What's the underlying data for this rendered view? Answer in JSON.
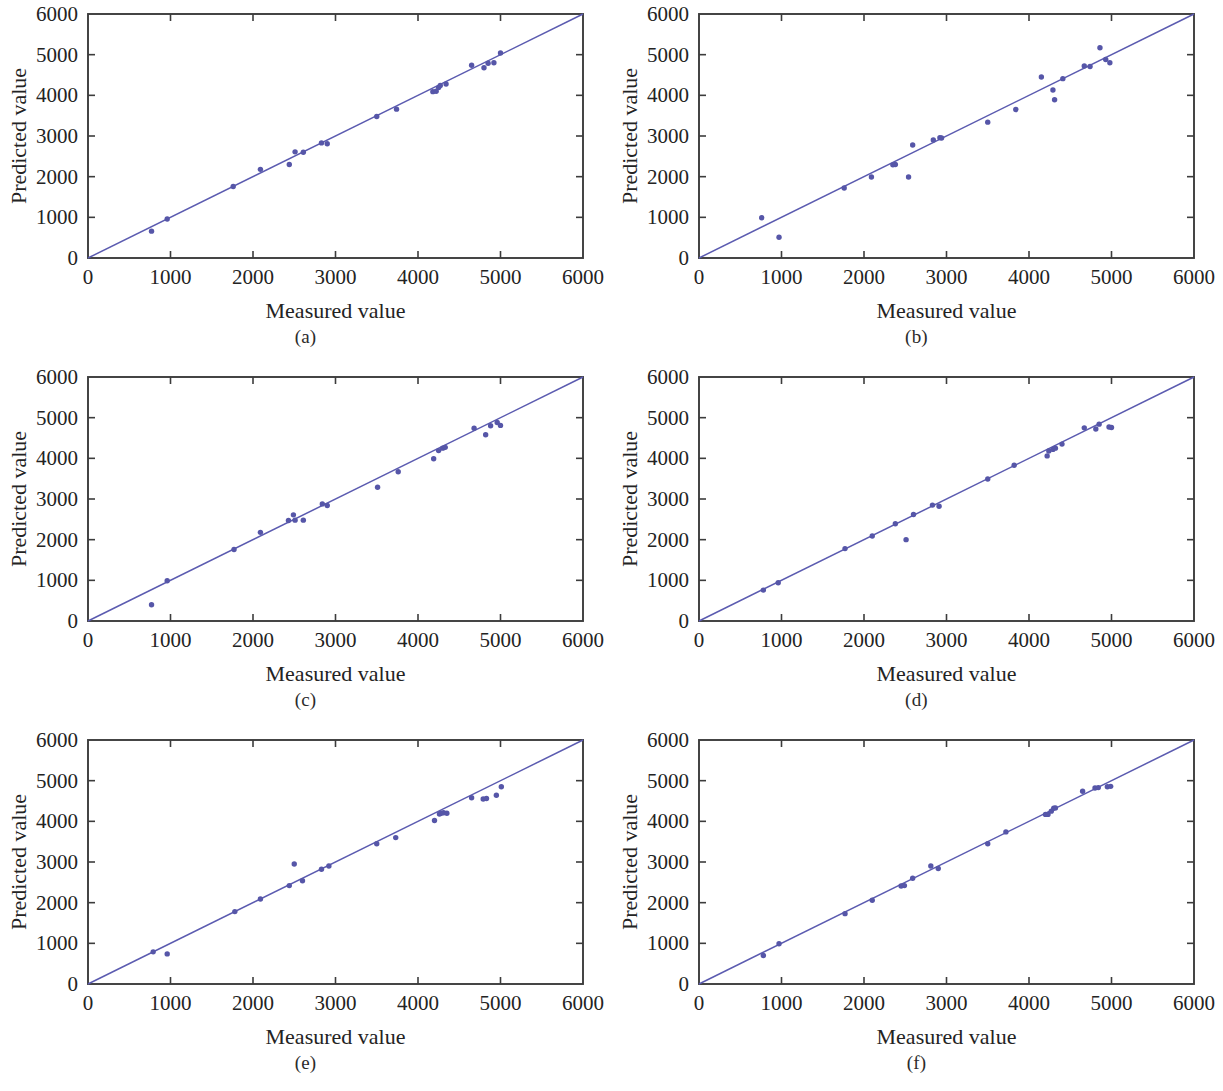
{
  "figure": {
    "panel_count": 6,
    "background": "#ffffff",
    "marker_color": "#5656a8",
    "line_color": "#5b5bb0",
    "axis_color": "#3c3c3c"
  },
  "chart_data": [
    {
      "type": "scatter",
      "panel": "(a)",
      "title": "",
      "xlabel": "Measured value",
      "ylabel": "Predicted value",
      "xlim": [
        0,
        6000
      ],
      "ylim": [
        0,
        6000
      ],
      "xticks": [
        0,
        1000,
        2000,
        3000,
        4000,
        5000,
        6000
      ],
      "yticks": [
        0,
        1000,
        2000,
        3000,
        4000,
        5000,
        6000
      ],
      "xticklabels": [
        "0",
        "1000",
        "2000",
        "3000",
        "4000",
        "5000",
        "6000"
      ],
      "yticklabels": [
        "0",
        "1000",
        "2000",
        "3000",
        "4000",
        "5000",
        "6000"
      ],
      "grid": false,
      "legend": "none",
      "reference_line": {
        "label": "y = x",
        "from": [
          0,
          0
        ],
        "to": [
          6000,
          6000
        ]
      },
      "points": [
        [
          770,
          660
        ],
        [
          960,
          960
        ],
        [
          1760,
          1760
        ],
        [
          2090,
          2180
        ],
        [
          2440,
          2300
        ],
        [
          2510,
          2610
        ],
        [
          2610,
          2600
        ],
        [
          2830,
          2830
        ],
        [
          2900,
          2810
        ],
        [
          3500,
          3480
        ],
        [
          3740,
          3660
        ],
        [
          4180,
          4090
        ],
        [
          4220,
          4100
        ],
        [
          4250,
          4190
        ],
        [
          4270,
          4240
        ],
        [
          4340,
          4280
        ],
        [
          4650,
          4740
        ],
        [
          4800,
          4680
        ],
        [
          4850,
          4790
        ],
        [
          4920,
          4800
        ],
        [
          5000,
          5040
        ]
      ]
    },
    {
      "type": "scatter",
      "panel": "(b)",
      "title": "",
      "xlabel": "Measured value",
      "ylabel": "Predicted value",
      "xlim": [
        0,
        6000
      ],
      "ylim": [
        0,
        6000
      ],
      "xticks": [
        0,
        1000,
        2000,
        3000,
        4000,
        5000,
        6000
      ],
      "yticks": [
        0,
        1000,
        2000,
        3000,
        4000,
        5000,
        6000
      ],
      "xticklabels": [
        "0",
        "1000",
        "2000",
        "3000",
        "4000",
        "5000",
        "6000"
      ],
      "yticklabels": [
        "0",
        "1000",
        "2000",
        "3000",
        "4000",
        "5000",
        "6000"
      ],
      "grid": false,
      "legend": "none",
      "reference_line": {
        "label": "y = x",
        "from": [
          0,
          0
        ],
        "to": [
          6000,
          6000
        ]
      },
      "points": [
        [
          760,
          990
        ],
        [
          970,
          510
        ],
        [
          1760,
          1720
        ],
        [
          2090,
          1990
        ],
        [
          2350,
          2290
        ],
        [
          2380,
          2300
        ],
        [
          2540,
          1990
        ],
        [
          2590,
          2780
        ],
        [
          2840,
          2900
        ],
        [
          2920,
          2960
        ],
        [
          2940,
          2950
        ],
        [
          3500,
          3340
        ],
        [
          3840,
          3650
        ],
        [
          4150,
          4450
        ],
        [
          4290,
          4130
        ],
        [
          4310,
          3890
        ],
        [
          4410,
          4410
        ],
        [
          4670,
          4720
        ],
        [
          4740,
          4710
        ],
        [
          4860,
          5170
        ],
        [
          4930,
          4880
        ],
        [
          4980,
          4800
        ]
      ]
    },
    {
      "type": "scatter",
      "panel": "(c)",
      "title": "",
      "xlabel": "Measured value",
      "ylabel": "Predicted value",
      "xlim": [
        0,
        6000
      ],
      "ylim": [
        0,
        6000
      ],
      "xticks": [
        0,
        1000,
        2000,
        3000,
        4000,
        5000,
        6000
      ],
      "yticks": [
        0,
        1000,
        2000,
        3000,
        4000,
        5000,
        6000
      ],
      "xticklabels": [
        "0",
        "1000",
        "2000",
        "3000",
        "4000",
        "5000",
        "6000"
      ],
      "yticklabels": [
        "0",
        "1000",
        "2000",
        "3000",
        "4000",
        "5000",
        "6000"
      ],
      "grid": false,
      "legend": "none",
      "reference_line": {
        "label": "y = x",
        "from": [
          0,
          0
        ],
        "to": [
          6000,
          6000
        ]
      },
      "points": [
        [
          770,
          400
        ],
        [
          960,
          990
        ],
        [
          1770,
          1760
        ],
        [
          2090,
          2180
        ],
        [
          2430,
          2470
        ],
        [
          2490,
          2610
        ],
        [
          2510,
          2480
        ],
        [
          2610,
          2480
        ],
        [
          2840,
          2880
        ],
        [
          2900,
          2840
        ],
        [
          3510,
          3290
        ],
        [
          3760,
          3670
        ],
        [
          4190,
          3990
        ],
        [
          4250,
          4190
        ],
        [
          4300,
          4250
        ],
        [
          4330,
          4270
        ],
        [
          4680,
          4740
        ],
        [
          4820,
          4580
        ],
        [
          4880,
          4800
        ],
        [
          4960,
          4880
        ],
        [
          5000,
          4810
        ]
      ]
    },
    {
      "type": "scatter",
      "panel": "(d)",
      "title": "",
      "xlabel": "Measured value",
      "ylabel": "Predicted value",
      "xlim": [
        0,
        6000
      ],
      "ylim": [
        0,
        6000
      ],
      "xticks": [
        0,
        1000,
        2000,
        3000,
        4000,
        5000,
        6000
      ],
      "yticks": [
        0,
        1000,
        2000,
        3000,
        4000,
        5000,
        6000
      ],
      "xticklabels": [
        "0",
        "1000",
        "2000",
        "3000",
        "4000",
        "5000",
        "6000"
      ],
      "yticklabels": [
        "0",
        "1000",
        "2000",
        "3000",
        "4000",
        "5000",
        "6000"
      ],
      "grid": false,
      "legend": "none",
      "reference_line": {
        "label": "y = x",
        "from": [
          0,
          0
        ],
        "to": [
          6000,
          6000
        ]
      },
      "points": [
        [
          780,
          760
        ],
        [
          960,
          940
        ],
        [
          1770,
          1780
        ],
        [
          2100,
          2090
        ],
        [
          2380,
          2390
        ],
        [
          2510,
          2000
        ],
        [
          2600,
          2620
        ],
        [
          2830,
          2850
        ],
        [
          2910,
          2820
        ],
        [
          3500,
          3490
        ],
        [
          3820,
          3830
        ],
        [
          4220,
          4060
        ],
        [
          4240,
          4180
        ],
        [
          4290,
          4220
        ],
        [
          4320,
          4250
        ],
        [
          4400,
          4350
        ],
        [
          4670,
          4750
        ],
        [
          4810,
          4720
        ],
        [
          4850,
          4840
        ],
        [
          4970,
          4770
        ],
        [
          5000,
          4760
        ]
      ]
    },
    {
      "type": "scatter",
      "panel": "(e)",
      "title": "",
      "xlabel": "Measured value",
      "ylabel": "Predicted value",
      "xlim": [
        0,
        6000
      ],
      "ylim": [
        0,
        6000
      ],
      "xticks": [
        0,
        1000,
        2000,
        3000,
        4000,
        5000,
        6000
      ],
      "yticks": [
        0,
        1000,
        2000,
        3000,
        4000,
        5000,
        6000
      ],
      "xticklabels": [
        "0",
        "1000",
        "2000",
        "3000",
        "4000",
        "5000",
        "6000"
      ],
      "yticklabels": [
        "0",
        "1000",
        "2000",
        "3000",
        "4000",
        "5000",
        "6000"
      ],
      "grid": false,
      "legend": "none",
      "reference_line": {
        "label": "y = x",
        "from": [
          0,
          0
        ],
        "to": [
          6000,
          6000
        ]
      },
      "points": [
        [
          790,
          790
        ],
        [
          960,
          740
        ],
        [
          1780,
          1780
        ],
        [
          2090,
          2090
        ],
        [
          2440,
          2420
        ],
        [
          2500,
          2950
        ],
        [
          2600,
          2540
        ],
        [
          2830,
          2820
        ],
        [
          2920,
          2900
        ],
        [
          3500,
          3450
        ],
        [
          3730,
          3600
        ],
        [
          4200,
          4020
        ],
        [
          4260,
          4180
        ],
        [
          4280,
          4200
        ],
        [
          4310,
          4210
        ],
        [
          4350,
          4200
        ],
        [
          4650,
          4580
        ],
        [
          4790,
          4550
        ],
        [
          4830,
          4560
        ],
        [
          4950,
          4640
        ],
        [
          5010,
          4850
        ]
      ]
    },
    {
      "type": "scatter",
      "panel": "(f)",
      "title": "",
      "xlabel": "Measured value",
      "ylabel": "Predicted value",
      "xlim": [
        0,
        6000
      ],
      "ylim": [
        0,
        6000
      ],
      "xticks": [
        0,
        1000,
        2000,
        3000,
        4000,
        5000,
        6000
      ],
      "yticks": [
        0,
        1000,
        2000,
        3000,
        4000,
        5000,
        6000
      ],
      "xticklabels": [
        "0",
        "1000",
        "2000",
        "3000",
        "4000",
        "5000",
        "6000"
      ],
      "yticklabels": [
        "0",
        "1000",
        "2000",
        "3000",
        "4000",
        "5000",
        "6000"
      ],
      "grid": false,
      "legend": "none",
      "reference_line": {
        "label": "y = x",
        "from": [
          0,
          0
        ],
        "to": [
          6000,
          6000
        ]
      },
      "points": [
        [
          780,
          700
        ],
        [
          970,
          990
        ],
        [
          1770,
          1730
        ],
        [
          2100,
          2060
        ],
        [
          2450,
          2410
        ],
        [
          2490,
          2420
        ],
        [
          2590,
          2600
        ],
        [
          2810,
          2900
        ],
        [
          2900,
          2840
        ],
        [
          3500,
          3450
        ],
        [
          3720,
          3740
        ],
        [
          4200,
          4170
        ],
        [
          4230,
          4170
        ],
        [
          4270,
          4250
        ],
        [
          4300,
          4320
        ],
        [
          4320,
          4330
        ],
        [
          4650,
          4740
        ],
        [
          4800,
          4820
        ],
        [
          4840,
          4830
        ],
        [
          4950,
          4850
        ],
        [
          4990,
          4860
        ]
      ]
    }
  ]
}
